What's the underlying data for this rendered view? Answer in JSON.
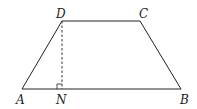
{
  "figure": {
    "type": "trapezoid",
    "vertices": [
      {
        "id": "A",
        "label": "A",
        "x": 22,
        "y": 89,
        "label_x": 16,
        "label_y": 104
      },
      {
        "id": "B",
        "label": "B",
        "x": 181,
        "y": 89,
        "label_x": 180,
        "label_y": 104
      },
      {
        "id": "C",
        "label": "C",
        "x": 140,
        "y": 21,
        "label_x": 139,
        "label_y": 18
      },
      {
        "id": "D",
        "label": "D",
        "x": 62,
        "y": 21,
        "label_x": 56,
        "label_y": 18
      }
    ],
    "foot": {
      "id": "N",
      "label": "N",
      "x": 62,
      "y": 89,
      "label_x": 56,
      "label_y": 104
    },
    "altitude": {
      "from": "D",
      "to": "N",
      "style": "dashed"
    },
    "right_angle_marker": {
      "at": "N",
      "size": 5
    },
    "colors": {
      "stroke": "#222222",
      "background": "#ffffff"
    }
  }
}
